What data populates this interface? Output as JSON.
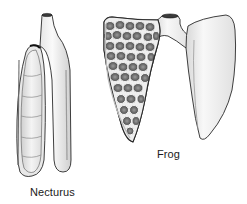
{
  "figure": {
    "specimens": [
      {
        "id": "necturus",
        "label": "Necturus",
        "description": "Simple elongated sac-like lungs; left lung shown opened"
      },
      {
        "id": "frog",
        "label": "Frog",
        "description": "Lungs with internal honeycomb septa; left lung shown opened"
      }
    ]
  },
  "colors": {
    "background": "#ffffff",
    "outline": "#2a2a2a",
    "fill_light": "#f2f2f2",
    "fill_shade": "#d0d0d0",
    "chamber_dark": "#3a3a3a",
    "chamber_mid": "#7a7a7a"
  }
}
